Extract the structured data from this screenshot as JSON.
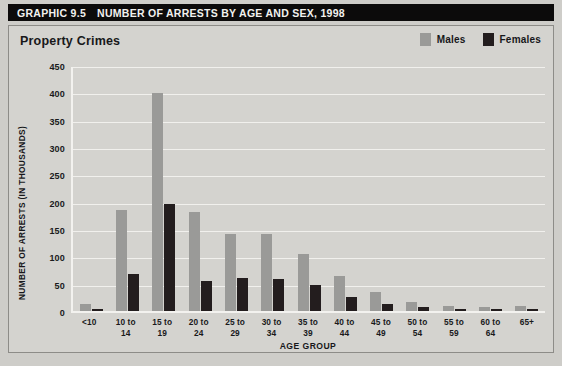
{
  "header": {
    "graphic_number": "GRAPHIC 9.5",
    "title": "NUMBER OF ARRESTS BY AGE AND SEX, 1998"
  },
  "subtitle": "Property Crimes",
  "legend": [
    {
      "label": "Males",
      "color": "#9a9a98"
    },
    {
      "label": "Females",
      "color": "#231d1e"
    }
  ],
  "colors": {
    "males": "#9a9a98",
    "females": "#231d1e",
    "panel_background": "#d4d3cf",
    "title_bar": "#0c0b0b",
    "gridline": "#f1f0ed"
  },
  "chart_data": {
    "type": "bar",
    "title": "Property Crimes",
    "xlabel": "AGE GROUP",
    "ylabel": "NUMBER OF ARRESTS (IN THOUSANDS)",
    "ylim": [
      0,
      450
    ],
    "yticks": [
      450,
      400,
      350,
      300,
      250,
      200,
      150,
      100,
      50,
      0
    ],
    "grid": true,
    "legend_position": "top-right",
    "categories": [
      "<10",
      "10 to 14",
      "15 to 19",
      "20 to 24",
      "25 to 29",
      "30 to 34",
      "35 to 39",
      "40 to 44",
      "45 to 49",
      "50 to 54",
      "55 to 59",
      "60 to 64",
      "65+"
    ],
    "series": [
      {
        "name": "Males",
        "color": "#9a9a98",
        "values": [
          13,
          184,
          398,
          181,
          141,
          140,
          104,
          64,
          35,
          17,
          10,
          8,
          9
        ]
      },
      {
        "name": "Females",
        "color": "#231d1e",
        "values": [
          3,
          68,
          195,
          55,
          60,
          58,
          47,
          25,
          13,
          7,
          4,
          3,
          4
        ]
      }
    ]
  }
}
